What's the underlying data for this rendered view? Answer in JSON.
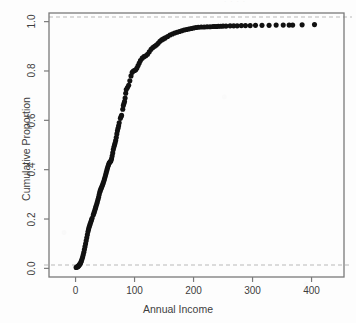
{
  "figure": {
    "scan_title_artifact": "· · · ·",
    "background_color": "#fdfdfd",
    "point_color": "#111111",
    "axis_color": "#7a7a7a",
    "text_color": "#3d3d3d",
    "refline_color": "#b9b9b9"
  },
  "chart_data": {
    "type": "scatter",
    "title": "",
    "subtitle": "",
    "xlabel": "Annual Income",
    "ylabel": "Cumulative Proportion",
    "xlim": [
      -45,
      455
    ],
    "ylim": [
      -0.035,
      1.035
    ],
    "xticks": [
      0,
      100,
      200,
      300,
      400
    ],
    "xticklabels": [
      "0",
      "100",
      "200",
      "300",
      "400"
    ],
    "yticks": [
      0.0,
      0.2,
      0.4,
      0.6,
      0.8,
      1.0
    ],
    "yticklabels": [
      "0.0",
      "0.2",
      "0.4",
      "0.6",
      "0.8",
      "1.0"
    ],
    "grid": false,
    "legend": null,
    "legend_position": "none",
    "reference_lines": [
      {
        "orientation": "horizontal",
        "y": 0.0,
        "style": "dashed",
        "color": "#b9b9b9"
      },
      {
        "orientation": "horizontal",
        "y": 1.0,
        "style": "dashed",
        "color": "#b9b9b9"
      }
    ],
    "annotations": [],
    "marker": "filled-circle",
    "marker_size": 3.1,
    "series": [
      {
        "name": "Empirical CDF of Annual Income",
        "x": [
          1,
          3,
          4,
          5,
          6,
          7,
          8,
          9,
          10,
          11,
          12,
          13,
          14,
          15,
          16,
          17,
          18,
          19,
          20,
          21,
          22,
          23,
          24,
          25,
          26,
          27,
          28,
          30,
          31,
          32,
          33,
          34,
          35,
          36,
          37,
          38,
          39,
          40,
          41,
          42,
          43,
          44,
          45,
          46,
          47,
          48,
          49,
          50,
          51,
          52,
          53,
          54,
          55,
          56,
          57,
          58,
          59,
          60,
          61,
          62,
          63,
          64,
          65,
          66,
          67,
          68,
          69,
          70,
          71,
          72,
          73,
          74,
          76,
          77,
          78,
          80,
          81,
          82,
          83,
          84,
          85,
          86,
          88,
          90,
          92,
          94,
          96,
          98,
          100,
          102,
          104,
          106,
          108,
          110,
          113,
          116,
          119,
          122,
          125,
          128,
          131,
          134,
          137,
          140,
          143,
          146,
          149,
          152,
          156,
          160,
          164,
          168,
          172,
          176,
          180,
          184,
          188,
          192,
          196,
          200,
          204,
          208,
          213,
          218,
          223,
          228,
          233,
          236,
          239,
          242,
          246,
          250,
          255,
          262,
          268,
          274,
          281,
          288,
          296,
          305,
          316,
          328,
          340,
          352,
          362,
          368,
          384,
          405
        ],
        "y": [
          0.004,
          0.006,
          0.008,
          0.01,
          0.013,
          0.016,
          0.02,
          0.025,
          0.031,
          0.038,
          0.046,
          0.055,
          0.065,
          0.076,
          0.088,
          0.1,
          0.112,
          0.124,
          0.136,
          0.148,
          0.158,
          0.167,
          0.175,
          0.182,
          0.189,
          0.196,
          0.203,
          0.216,
          0.223,
          0.23,
          0.238,
          0.246,
          0.254,
          0.262,
          0.27,
          0.279,
          0.288,
          0.298,
          0.308,
          0.316,
          0.322,
          0.328,
          0.334,
          0.34,
          0.347,
          0.354,
          0.362,
          0.37,
          0.379,
          0.388,
          0.397,
          0.406,
          0.414,
          0.421,
          0.427,
          0.43,
          0.433,
          0.436,
          0.444,
          0.455,
          0.468,
          0.482,
          0.492,
          0.5,
          0.508,
          0.518,
          0.53,
          0.545,
          0.558,
          0.568,
          0.578,
          0.59,
          0.608,
          0.614,
          0.62,
          0.645,
          0.66,
          0.668,
          0.676,
          0.69,
          0.71,
          0.725,
          0.733,
          0.742,
          0.76,
          0.78,
          0.795,
          0.8,
          0.802,
          0.805,
          0.812,
          0.822,
          0.832,
          0.842,
          0.852,
          0.858,
          0.862,
          0.868,
          0.878,
          0.888,
          0.895,
          0.9,
          0.905,
          0.912,
          0.92,
          0.926,
          0.93,
          0.934,
          0.94,
          0.946,
          0.95,
          0.954,
          0.957,
          0.96,
          0.963,
          0.966,
          0.968,
          0.97,
          0.972,
          0.974,
          0.976,
          0.977,
          0.978,
          0.978,
          0.979,
          0.979,
          0.98,
          0.98,
          0.98,
          0.981,
          0.981,
          0.982,
          0.982,
          0.983,
          0.983,
          0.983,
          0.984,
          0.984,
          0.984,
          0.985,
          0.985,
          0.985,
          0.986,
          0.986,
          0.986,
          0.986,
          0.987,
          0.988
        ]
      }
    ]
  }
}
